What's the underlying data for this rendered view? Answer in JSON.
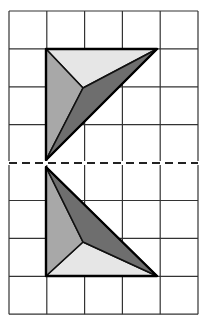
{
  "diagram": {
    "grid": {
      "cols": 5,
      "rows": 8,
      "left": 9,
      "top": 11,
      "cell_w": 37.8,
      "cell_h": 37.9,
      "line_color": "#333333"
    },
    "mirror_line": {
      "y": 163,
      "color": "#222222",
      "style": "dashed"
    },
    "shapes": [
      {
        "name": "upper-pyramid",
        "outer": [
          [
            46,
            49
          ],
          [
            157,
            49
          ],
          [
            46,
            160
          ]
        ],
        "apex": [
          83,
          88
        ],
        "faces": [
          {
            "name": "top-face",
            "color": "#e6e6e6"
          },
          {
            "name": "left-face",
            "color": "#a8a8a8"
          },
          {
            "name": "right-face",
            "color": "#6e6e6e"
          }
        ]
      },
      {
        "name": "lower-pyramid",
        "outer": [
          [
            46,
            167
          ],
          [
            46,
            276
          ],
          [
            157,
            276
          ]
        ],
        "apex": [
          83,
          242
        ],
        "faces": [
          {
            "name": "bottom-face",
            "color": "#e6e6e6"
          },
          {
            "name": "left-face",
            "color": "#a8a8a8"
          },
          {
            "name": "right-face",
            "color": "#6e6e6e"
          }
        ]
      }
    ]
  }
}
